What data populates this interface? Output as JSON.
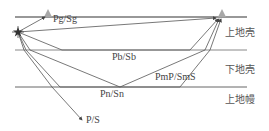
{
  "diagram": {
    "type": "seismic-ray-path-schematic",
    "rays": [
      {
        "id": "pg",
        "label": "Pg/Sg"
      },
      {
        "id": "pb",
        "label": "Pb/Sb"
      },
      {
        "id": "pmp",
        "label": "PmP/SmS"
      },
      {
        "id": "pn",
        "label": "Pn/Sn"
      },
      {
        "id": "ps",
        "label": "P/S"
      }
    ],
    "layers": [
      {
        "id": "upper-crust",
        "label": "上地壳"
      },
      {
        "id": "lower-crust",
        "label": "下地壳"
      },
      {
        "id": "upper-mantle",
        "label": "上地幔"
      }
    ],
    "stations": 2,
    "colors": {
      "line": "#333333",
      "ray": "#555555",
      "interface": "#777777",
      "station": "#999999"
    }
  }
}
